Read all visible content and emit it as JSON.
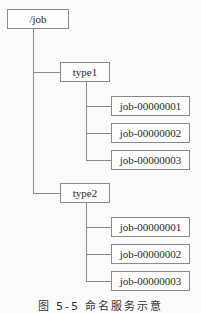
{
  "diagram": {
    "root": {
      "label": "/job"
    },
    "groups": [
      {
        "label": "type1",
        "children": [
          "job-00000001",
          "job-00000002",
          "job-00000003"
        ]
      },
      {
        "label": "type2",
        "children": [
          "job-00000001",
          "job-00000002",
          "job-00000003"
        ]
      }
    ],
    "caption": "图 5-5 命名服务示意"
  }
}
